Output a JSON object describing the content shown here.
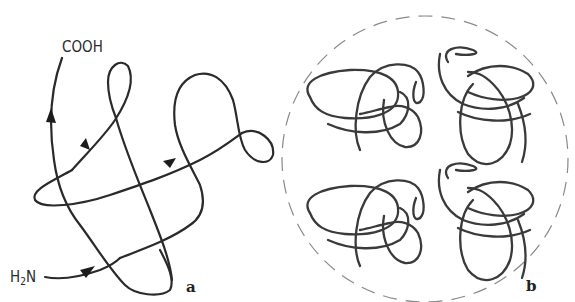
{
  "figure": {
    "panel_a": {
      "label": "a",
      "c_terminus": "COOH",
      "n_terminus_prefix": "H",
      "n_terminus_subscript": "2",
      "n_terminus_suffix": "N",
      "description": "Knotted polypeptide chain with direction arrows"
    },
    "panel_b": {
      "label": "b",
      "description": "Four knot diagrams arranged in a dashed circle",
      "knot_count": 4
    }
  }
}
